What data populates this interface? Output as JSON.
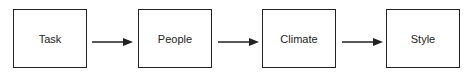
{
  "diagram": {
    "type": "flow",
    "nodes": [
      {
        "id": "task",
        "label": "Task"
      },
      {
        "id": "people",
        "label": "People"
      },
      {
        "id": "climate",
        "label": "Climate"
      },
      {
        "id": "style",
        "label": "Style"
      }
    ],
    "edges": [
      {
        "from": "task",
        "to": "people"
      },
      {
        "from": "people",
        "to": "climate"
      },
      {
        "from": "climate",
        "to": "style"
      }
    ],
    "colors": {
      "stroke": "#222222",
      "background": "#ffffff"
    }
  }
}
